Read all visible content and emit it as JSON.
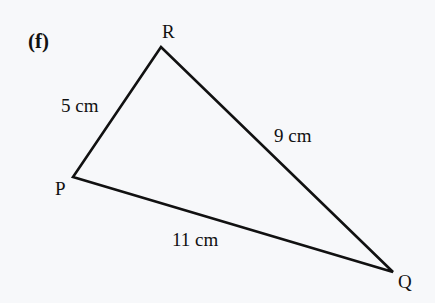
{
  "part_label": "(f)",
  "vertices": {
    "R": {
      "label": "R",
      "x": 161,
      "y": 47
    },
    "P": {
      "label": "P",
      "x": 73,
      "y": 177
    },
    "Q": {
      "label": "Q",
      "x": 393,
      "y": 272
    }
  },
  "sides": {
    "PR": {
      "label": "5 cm"
    },
    "RQ": {
      "label": "9 cm"
    },
    "PQ": {
      "label": "11 cm"
    }
  },
  "colors": {
    "line": "#111111",
    "background": "#f7f8fa"
  }
}
